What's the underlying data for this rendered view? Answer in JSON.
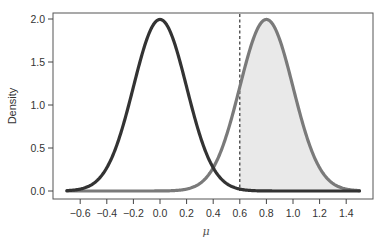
{
  "chart_data": {
    "type": "line",
    "title": "",
    "xlabel": "μ",
    "ylabel": "Density",
    "xlim": [
      -0.7,
      1.5
    ],
    "ylim": [
      0,
      2.0
    ],
    "x_ticks": [
      -0.6,
      -0.4,
      -0.2,
      0.0,
      0.2,
      0.4,
      0.6,
      0.8,
      1.0,
      1.2,
      1.4
    ],
    "x_tick_labels": [
      "−0.6",
      "−0.4",
      "−0.2",
      "0.0",
      "0.2",
      "0.4",
      "0.6",
      "0.8",
      "1.0",
      "1.2",
      "1.4"
    ],
    "y_ticks": [
      0.0,
      0.5,
      1.0,
      1.5,
      2.0
    ],
    "y_tick_labels": [
      "0.0",
      "0.5",
      "1.0",
      "1.5",
      "2.0"
    ],
    "grid": false,
    "legend": null,
    "series": [
      {
        "name": "null-distribution",
        "distribution": "normal",
        "mean": 0.0,
        "sd": 0.2,
        "peak_density": 2.0,
        "color": "#333333",
        "x_range": [
          -0.7,
          1.5
        ]
      },
      {
        "name": "alternative-distribution",
        "distribution": "normal",
        "mean": 0.8,
        "sd": 0.2,
        "peak_density": 2.0,
        "color": "#7a7a7a",
        "x_range": [
          -0.7,
          1.5
        ]
      }
    ],
    "shaded_region": {
      "series": "alternative-distribution",
      "from": 0.6,
      "to": 1.5,
      "color": "#e9e9e9"
    },
    "vertical_line": {
      "x": 0.6,
      "style": "dashed",
      "color": "#222222"
    }
  }
}
